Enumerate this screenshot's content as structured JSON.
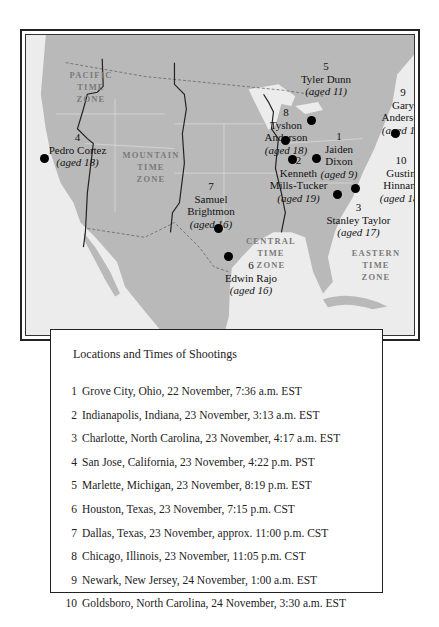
{
  "map": {
    "zones": [
      {
        "name": "pacific",
        "lines": [
          "PACIFIC",
          "TIME",
          "ZONE"
        ]
      },
      {
        "name": "mountain",
        "lines": [
          "MOUNTAIN",
          "TIME",
          "ZONE"
        ]
      },
      {
        "name": "central",
        "lines": [
          "CENTRAL",
          "TIME",
          "ZONE"
        ]
      },
      {
        "name": "eastern",
        "lines": [
          "EASTERN",
          "TIME",
          "ZONE"
        ]
      }
    ],
    "markers": [
      {
        "num": "1",
        "name_lines": [
          "Jaiden",
          "Dixon"
        ],
        "age": "(aged 9)"
      },
      {
        "num": "2",
        "name_lines": [
          "Kenneth",
          "Mills-Tucker"
        ],
        "age": "(aged 19)"
      },
      {
        "num": "3",
        "name_lines": [
          "Stanley Taylor"
        ],
        "age": "(aged 17)"
      },
      {
        "num": "4",
        "name_lines": [
          "Pedro Cortez"
        ],
        "age": "(aged 18)"
      },
      {
        "num": "5",
        "name_lines": [
          "Tyler Dunn"
        ],
        "age": "(aged 11)"
      },
      {
        "num": "6",
        "name_lines": [
          "Edwin Rajo"
        ],
        "age": "(aged 16)"
      },
      {
        "num": "7",
        "name_lines": [
          "Samuel",
          "Brightmon"
        ],
        "age": "(aged 16)"
      },
      {
        "num": "8",
        "name_lines": [
          "Tyshon",
          "Anderson"
        ],
        "age": "(aged 18)"
      },
      {
        "num": "9",
        "name_lines": [
          "Gary",
          "Anderson"
        ],
        "age": "(aged 18)"
      },
      {
        "num": "10",
        "name_lines": [
          "Gustin",
          "Hinnant"
        ],
        "age": "(aged 18)"
      }
    ],
    "colors": {
      "land": "#b9b9b9",
      "water": "#ececec",
      "border": "#333333",
      "zone_text": "#7a7a7a"
    }
  },
  "legend": {
    "title": "Locations and Times of Shootings",
    "items": [
      {
        "num": "1",
        "text": "Grove City, Ohio, 22 November, 7:36 a.m. EST"
      },
      {
        "num": "2",
        "text": "Indianapolis, Indiana, 23 November, 3:13 a.m. EST"
      },
      {
        "num": "3",
        "text": "Charlotte, North Carolina, 23 November, 4:17 a.m. EST"
      },
      {
        "num": "4",
        "text": "San Jose, California, 23 November, 4:22 p.m. PST"
      },
      {
        "num": "5",
        "text": "Marlette, Michigan, 23 November, 8:19 p.m. EST"
      },
      {
        "num": "6",
        "text": "Houston, Texas, 23 November, 7:15 p.m. CST"
      },
      {
        "num": "7",
        "text": "Dallas, Texas, 23 November, approx. 11:00 p.m. CST"
      },
      {
        "num": "8",
        "text": "Chicago, Illinois, 23 November, 11:05 p.m. CST"
      },
      {
        "num": "9",
        "text": "Newark, New Jersey, 24 November, 1:00 a.m. EST"
      },
      {
        "num": "10",
        "text": "Goldsboro, North Carolina, 24 November, 3:30 a.m. EST"
      }
    ]
  }
}
